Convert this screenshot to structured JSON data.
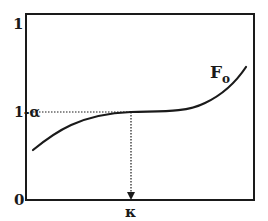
{
  "diagram": {
    "type": "function-curve",
    "y_axis": {
      "top_label": "1",
      "bottom_label": "0",
      "marked_level_label": "1-α"
    },
    "x_axis": {
      "marked_point_label": "κ"
    },
    "curve": {
      "label_main": "F",
      "label_sub": "o",
      "description": "Increasing curve that flattens at level 1-α near κ, then rises again"
    },
    "colors": {
      "ink": "#1a1a1a",
      "background": "#ffffff"
    }
  }
}
